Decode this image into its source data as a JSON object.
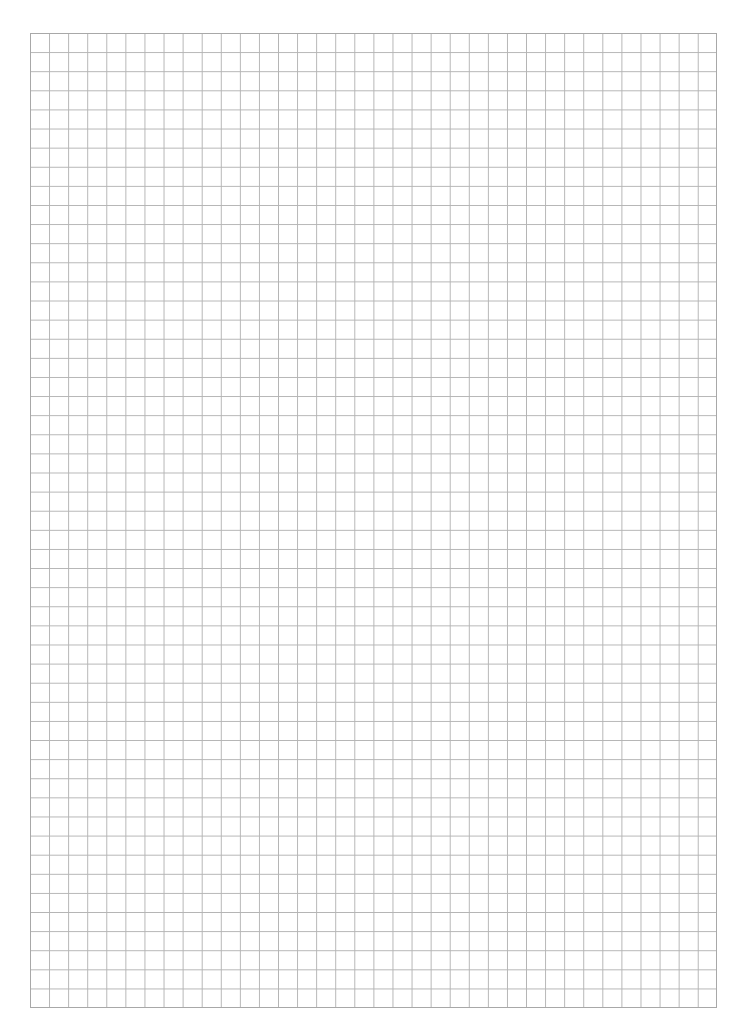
{
  "page": {
    "type": "grid-paper",
    "background_color": "#ffffff",
    "line_color": "#b4b4b4",
    "border_color": "#a8a8a8"
  },
  "grid": {
    "columns": 36,
    "rows": 51,
    "left": 30,
    "top": 33,
    "width": 687,
    "height": 975
  }
}
